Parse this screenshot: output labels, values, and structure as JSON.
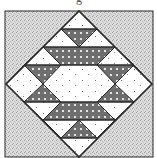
{
  "diagram": {
    "type": "quilt-block",
    "caption_fragment": "g",
    "colors": {
      "background_fabric": "#d8d8d8",
      "background_speckle": "#9a9a9a",
      "light_fabric": "#ffffff",
      "light_dots": "#7a7a7a",
      "dark_fabric": "#6e6e6e",
      "dark_dots": "#ffffff",
      "outline": "#2a2a2a"
    },
    "geometry": {
      "outer_square": {
        "x": 5,
        "y": 11,
        "w": 148,
        "h": 146
      },
      "diamond": {
        "top": [
          79,
          11
        ],
        "right": [
          152,
          84
        ],
        "bottom": [
          79,
          157
        ],
        "left": [
          6,
          84
        ]
      },
      "horizontal_lines_y": [
        29,
        47,
        65,
        102,
        120,
        138
      ]
    },
    "pieces": {
      "background_corners": 4,
      "dark_triangles": 6,
      "dark_trapezoids": 2,
      "light_center_hexagon": 1
    }
  }
}
